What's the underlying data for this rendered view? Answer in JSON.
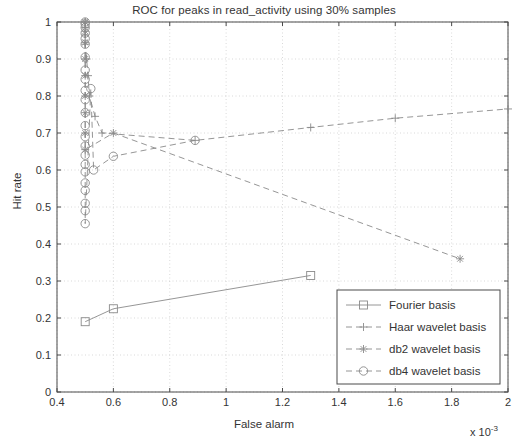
{
  "chart_data": {
    "type": "scatter",
    "title": "ROC for peaks in read_activity using 30% samples",
    "xlabel": "False alarm",
    "ylabel": "Hit rate",
    "x_multiplier": "x 10",
    "x_multiplier_exponent": "-3",
    "xlim": [
      0.4,
      2.0
    ],
    "ylim": [
      0,
      1
    ],
    "xticks": [
      "0.4",
      "0.6",
      "0.8",
      "1",
      "1.2",
      "1.4",
      "1.6",
      "1.8",
      "2"
    ],
    "xtick_values": [
      0.4,
      0.6,
      0.8,
      1.0,
      1.2,
      1.4,
      1.6,
      1.8,
      2.0
    ],
    "yticks": [
      "0",
      "0.1",
      "0.2",
      "0.3",
      "0.4",
      "0.5",
      "0.6",
      "0.7",
      "0.8",
      "0.9",
      "1"
    ],
    "ytick_values": [
      0,
      0.1,
      0.2,
      0.3,
      0.4,
      0.5,
      0.6,
      0.7,
      0.8,
      0.9,
      1.0
    ],
    "grid": true,
    "legend_position": "lower right",
    "series": [
      {
        "name": "Fourier basis",
        "marker": "square",
        "linestyle": "solid",
        "color": "#8a8a8a",
        "points": [
          [
            0.5,
            0.19
          ],
          [
            0.6,
            0.225
          ],
          [
            1.3,
            0.315
          ]
        ]
      },
      {
        "name": "Haar wavelet basis",
        "marker": "plus",
        "linestyle": "dashed",
        "color": "#8a8a8a",
        "points": [
          [
            0.5,
            1.0
          ],
          [
            0.5,
            0.985
          ],
          [
            0.5,
            0.965
          ],
          [
            0.5,
            0.94
          ],
          [
            0.505,
            0.9
          ],
          [
            0.51,
            0.855
          ],
          [
            0.515,
            0.8
          ],
          [
            0.535,
            0.745
          ],
          [
            0.56,
            0.7
          ],
          [
            0.89,
            0.68
          ],
          [
            1.3,
            0.715
          ],
          [
            1.6,
            0.74
          ],
          [
            2.0,
            0.765
          ]
        ]
      },
      {
        "name": "db2 wavelet basis",
        "marker": "asterisk",
        "linestyle": "dashed",
        "color": "#8a8a8a",
        "points": [
          [
            0.5,
            1.0
          ],
          [
            0.5,
            0.975
          ],
          [
            0.5,
            0.945
          ],
          [
            0.5,
            0.9
          ],
          [
            0.5,
            0.855
          ],
          [
            0.5,
            0.8
          ],
          [
            0.5,
            0.755
          ],
          [
            0.5,
            0.7
          ],
          [
            0.5,
            0.655
          ],
          [
            0.6,
            0.7
          ],
          [
            1.83,
            0.36
          ]
        ]
      },
      {
        "name": "db4 wavelet basis",
        "marker": "circle",
        "linestyle": "dashed",
        "color": "#8a8a8a",
        "points": [
          [
            0.5,
            1.0
          ],
          [
            0.5,
            0.995
          ],
          [
            0.5,
            0.985
          ],
          [
            0.5,
            0.97
          ],
          [
            0.5,
            0.955
          ],
          [
            0.5,
            0.94
          ],
          [
            0.5,
            0.905
          ],
          [
            0.5,
            0.87
          ],
          [
            0.5,
            0.845
          ],
          [
            0.5,
            0.815
          ],
          [
            0.5,
            0.79
          ],
          [
            0.5,
            0.755
          ],
          [
            0.5,
            0.72
          ],
          [
            0.5,
            0.69
          ],
          [
            0.5,
            0.665
          ],
          [
            0.5,
            0.64
          ],
          [
            0.5,
            0.615
          ],
          [
            0.5,
            0.595
          ],
          [
            0.5,
            0.565
          ],
          [
            0.5,
            0.545
          ],
          [
            0.5,
            0.51
          ],
          [
            0.5,
            0.49
          ],
          [
            0.5,
            0.455
          ],
          [
            0.52,
            0.82
          ],
          [
            0.53,
            0.6
          ],
          [
            0.6,
            0.637
          ],
          [
            0.89,
            0.68
          ]
        ]
      }
    ],
    "legend_entries": [
      {
        "label": "Fourier basis",
        "marker": "square",
        "linestyle": "solid"
      },
      {
        "label": "Haar wavelet basis",
        "marker": "plus",
        "linestyle": "dashed"
      },
      {
        "label": "db2 wavelet basis",
        "marker": "asterisk",
        "linestyle": "dashed"
      },
      {
        "label": "db4 wavelet basis",
        "marker": "circle",
        "linestyle": "dashed"
      }
    ]
  },
  "colors": {
    "axis": "#4a4a4a",
    "grid": "#c8c8c8",
    "line": "#8a8a8a",
    "text": "#343434",
    "background": "#ffffff"
  }
}
